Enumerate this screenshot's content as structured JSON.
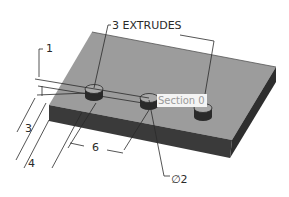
{
  "drawing": {
    "callout_extrudes": "3 EXTRUDES",
    "section_label": "Section 0",
    "diameter_label": "∅2",
    "dimensions": {
      "d1": "1",
      "d3": "3",
      "d4": "4",
      "d6": "6"
    }
  },
  "colors": {
    "top_face": "#9c9c9c",
    "front_face": "#3a3a3a",
    "side_face": "#2e2e2e",
    "boss_top": "#a8a8a8",
    "boss_side": "#2a2a2a",
    "line": "#2a2a2a",
    "background": "#ffffff"
  }
}
